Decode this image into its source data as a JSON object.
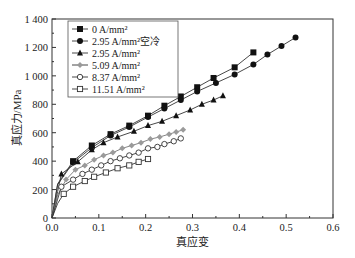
{
  "chart_data": {
    "type": "line",
    "title": "",
    "xlabel": "真应变",
    "ylabel": "真应力/MPa",
    "xlim": [
      0.0,
      0.6
    ],
    "ylim": [
      0,
      1400
    ],
    "xticks": [
      "0.0",
      "0.1",
      "0.2",
      "0.3",
      "0.4",
      "0.5",
      "0.6"
    ],
    "yticks": [
      "0",
      "200",
      "400",
      "600",
      "800",
      "1 000",
      "1 200",
      "1 400"
    ],
    "grid": false,
    "legend_position": "upper-left inside",
    "series": [
      {
        "name": "0 A/mm²",
        "marker": "filled-square",
        "color": "#111111",
        "x": [
          0.045,
          0.085,
          0.125,
          0.165,
          0.205,
          0.24,
          0.275,
          0.31,
          0.345,
          0.39,
          0.43
        ],
        "y": [
          400,
          510,
          590,
          650,
          720,
          790,
          855,
          920,
          985,
          1060,
          1165
        ]
      },
      {
        "name": "2.95 A/mm²空冷",
        "marker": "filled-circle",
        "color": "#111111",
        "x": [
          0.045,
          0.085,
          0.125,
          0.165,
          0.205,
          0.24,
          0.275,
          0.31,
          0.35,
          0.39,
          0.43,
          0.46,
          0.49,
          0.52
        ],
        "y": [
          390,
          495,
          580,
          640,
          710,
          770,
          830,
          890,
          950,
          1010,
          1080,
          1150,
          1210,
          1270
        ]
      },
      {
        "name": "2.95 A/mm²",
        "marker": "filled-triangle",
        "color": "#111111",
        "x": [
          0.02,
          0.055,
          0.085,
          0.11,
          0.14,
          0.175,
          0.205,
          0.235,
          0.265,
          0.295,
          0.32,
          0.345,
          0.365
        ],
        "y": [
          310,
          395,
          480,
          530,
          570,
          610,
          650,
          680,
          720,
          760,
          800,
          830,
          860
        ]
      },
      {
        "name": "5.09 A/mm²",
        "marker": "gray-diamond",
        "color": "#999999",
        "x": [
          0.03,
          0.05,
          0.07,
          0.09,
          0.11,
          0.13,
          0.15,
          0.17,
          0.19,
          0.21,
          0.23,
          0.25,
          0.265,
          0.28
        ],
        "y": [
          270,
          340,
          370,
          410,
          440,
          460,
          490,
          510,
          530,
          555,
          570,
          590,
          605,
          620
        ]
      },
      {
        "name": "8.37 A/mm²",
        "marker": "open-circle",
        "color": "#333333",
        "x": [
          0.02,
          0.045,
          0.065,
          0.085,
          0.105,
          0.125,
          0.145,
          0.165,
          0.185,
          0.205,
          0.225,
          0.24,
          0.26,
          0.275
        ],
        "y": [
          220,
          270,
          310,
          340,
          370,
          400,
          420,
          440,
          460,
          490,
          500,
          520,
          540,
          560
        ]
      },
      {
        "name": "11.51 A/mm²",
        "marker": "open-square",
        "color": "#333333",
        "x": [
          0.025,
          0.045,
          0.07,
          0.09,
          0.115,
          0.14,
          0.165,
          0.185,
          0.205
        ],
        "y": [
          170,
          220,
          260,
          290,
          320,
          350,
          370,
          395,
          415
        ]
      }
    ]
  }
}
